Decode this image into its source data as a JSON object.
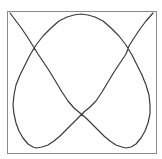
{
  "figure": {
    "width": 162,
    "height": 159,
    "frame": {
      "x": 7.5,
      "y": 11.5,
      "width": 149,
      "height": 142,
      "stroke": "#8a8a8a"
    },
    "curve": {
      "stroke": "#3a3a3a",
      "points": [
        [
          10,
          13
        ],
        [
          16,
          21
        ],
        [
          22,
          29
        ],
        [
          28,
          38
        ],
        [
          33,
          46
        ],
        [
          38,
          54
        ],
        [
          44,
          63
        ],
        [
          50,
          72
        ],
        [
          56,
          82
        ],
        [
          62,
          92
        ],
        [
          68,
          101
        ],
        [
          74,
          108
        ],
        [
          80,
          113
        ],
        [
          86,
          118
        ],
        [
          92,
          124
        ],
        [
          98,
          130
        ],
        [
          104,
          136
        ],
        [
          110,
          141
        ],
        [
          116,
          145
        ],
        [
          122,
          147
        ],
        [
          126,
          148
        ],
        [
          131,
          147
        ],
        [
          136,
          144
        ],
        [
          141,
          138
        ],
        [
          145,
          131
        ],
        [
          148,
          123
        ],
        [
          150,
          114
        ],
        [
          150,
          105
        ],
        [
          149,
          95
        ],
        [
          146,
          85
        ],
        [
          142,
          75
        ],
        [
          137,
          65
        ],
        [
          132,
          55
        ],
        [
          126,
          45
        ],
        [
          119,
          36
        ],
        [
          111,
          28
        ],
        [
          103,
          21
        ],
        [
          95,
          17
        ],
        [
          88,
          15
        ],
        [
          81,
          14
        ],
        [
          74,
          15
        ],
        [
          67,
          17
        ],
        [
          59,
          21
        ],
        [
          51,
          28
        ],
        [
          43,
          36
        ],
        [
          36,
          45
        ],
        [
          30,
          55
        ],
        [
          25,
          65
        ],
        [
          20,
          75
        ],
        [
          16,
          85
        ],
        [
          14,
          95
        ],
        [
          13,
          105
        ],
        [
          14,
          114
        ],
        [
          16,
          123
        ],
        [
          19,
          131
        ],
        [
          23,
          138
        ],
        [
          28,
          144
        ],
        [
          33,
          147
        ],
        [
          36,
          148
        ],
        [
          42,
          147
        ],
        [
          48,
          145
        ],
        [
          54,
          141
        ],
        [
          60,
          136
        ],
        [
          66,
          130
        ],
        [
          72,
          124
        ],
        [
          78,
          118
        ],
        [
          84,
          112
        ],
        [
          90,
          107
        ],
        [
          96,
          101
        ],
        [
          102,
          92
        ],
        [
          108,
          82
        ],
        [
          114,
          72
        ],
        [
          120,
          63
        ],
        [
          126,
          54
        ],
        [
          129,
          46
        ],
        [
          134,
          38
        ],
        [
          140,
          29
        ],
        [
          146,
          21
        ],
        [
          153,
          13
        ]
      ]
    }
  }
}
